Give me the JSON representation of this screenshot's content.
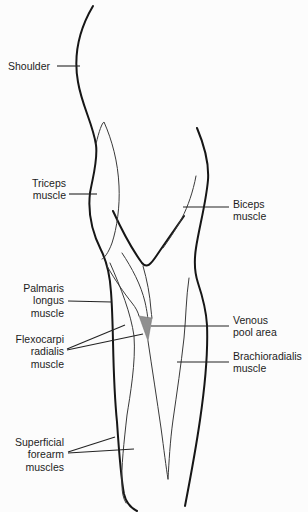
{
  "figure": {
    "type": "anatomical-line-diagram",
    "background_color": "#fcfcfc",
    "outline_color": "#161616",
    "muscle_line_color": "#3a3a3a",
    "leader_line_color": "#232323",
    "venous_pool_fill": "#8f8f8f",
    "label_text_color": "#1c1c1c"
  },
  "labels": [
    {
      "id": "shoulder",
      "text": "Shoulder",
      "align": "left"
    },
    {
      "id": "triceps",
      "text": "Triceps\nmuscle",
      "align": "right"
    },
    {
      "id": "biceps",
      "text": "Biceps\nmuscle",
      "align": "left"
    },
    {
      "id": "palmaris",
      "text": "Palmaris\nlongus\nmuscle",
      "align": "right"
    },
    {
      "id": "flexocarpi",
      "text": "Flexocarpi\nradialis\nmuscle",
      "align": "right"
    },
    {
      "id": "venous",
      "text": "Venous\npool area",
      "align": "left"
    },
    {
      "id": "brachioradialis",
      "text": "Brachioradialis\nmuscle",
      "align": "left"
    },
    {
      "id": "superficial",
      "text": "Superficial\nforearm\nmuscles",
      "align": "right"
    }
  ]
}
